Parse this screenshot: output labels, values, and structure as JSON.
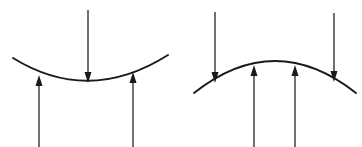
{
  "figure": {
    "kind": "mechanics-force-diagram",
    "canvas": {
      "width": 362,
      "height": 147
    },
    "background_color": "#ffffff",
    "ink_color": "#1a1a1a",
    "panels": [
      {
        "id": "left-panel",
        "name": "concave-up-beam",
        "description": "Beam curved concave upward (sagging) with one downward load at mid-span and two upward reactions",
        "curve": {
          "shape": "concave-up",
          "start": {
            "x": 13,
            "y": 58
          },
          "control": {
            "x": 89,
            "y": 105
          },
          "end": {
            "x": 168,
            "y": 55
          },
          "stroke_width": 1.9
        },
        "arrows": [
          {
            "id": "left-down-load",
            "name": "downward-load-arrow",
            "direction": "down",
            "x": 88,
            "y_tail": 10,
            "y_tip": 83,
            "head_width": 7,
            "head_length": 11
          },
          {
            "id": "left-up-reaction-1",
            "name": "upward-reaction-arrow-left",
            "direction": "up",
            "x": 39,
            "y_tail": 147,
            "y_tip": 75,
            "head_width": 7,
            "head_length": 11
          },
          {
            "id": "left-up-reaction-2",
            "name": "upward-reaction-arrow-right",
            "direction": "up",
            "x": 133,
            "y_tail": 147,
            "y_tip": 72,
            "head_width": 7,
            "head_length": 11
          }
        ]
      },
      {
        "id": "right-panel",
        "name": "concave-down-beam",
        "description": "Beam curved concave downward (arching) with two downward loads at the ends and two upward reactions near mid-span",
        "curve": {
          "shape": "concave-down",
          "start": {
            "x": 194,
            "y": 93
          },
          "control": {
            "x": 275,
            "y": 29
          },
          "end": {
            "x": 356,
            "y": 93
          },
          "stroke_width": 1.9
        },
        "arrows": [
          {
            "id": "right-down-load-1",
            "name": "downward-load-arrow-left",
            "direction": "down",
            "x": 215,
            "y_tail": 12,
            "y_tip": 83,
            "head_width": 7,
            "head_length": 11
          },
          {
            "id": "right-down-load-2",
            "name": "downward-load-arrow-right",
            "direction": "down",
            "x": 334,
            "y_tail": 13,
            "y_tip": 82,
            "head_width": 7,
            "head_length": 11
          },
          {
            "id": "right-up-reaction-1",
            "name": "upward-reaction-arrow-inner-left",
            "direction": "up",
            "x": 254,
            "y_tail": 147,
            "y_tip": 65,
            "head_width": 7,
            "head_length": 11
          },
          {
            "id": "right-up-reaction-2",
            "name": "upward-reaction-arrow-inner-right",
            "direction": "up",
            "x": 295,
            "y_tail": 147,
            "y_tip": 65,
            "head_width": 7,
            "head_length": 11
          }
        ]
      }
    ]
  }
}
